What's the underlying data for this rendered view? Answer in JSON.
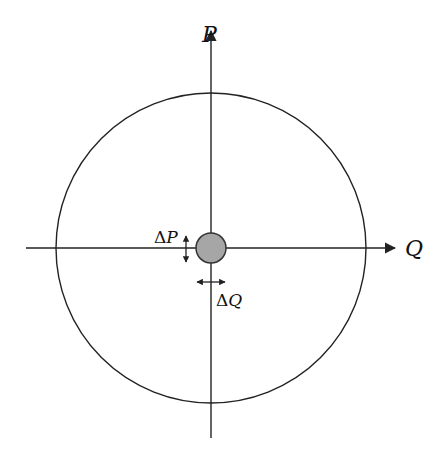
{
  "diagram": {
    "axes": {
      "vertical_label": "P",
      "horizontal_label": "Q"
    },
    "center_marker": {
      "fill": "#a6a6a6",
      "stroke": "#333333"
    },
    "annotations": {
      "delta_p": {
        "delta": "Δ",
        "var": "P"
      },
      "delta_q": {
        "delta": "Δ",
        "var": "Q"
      }
    },
    "colors": {
      "line": "#222222",
      "background": "#ffffff"
    }
  }
}
